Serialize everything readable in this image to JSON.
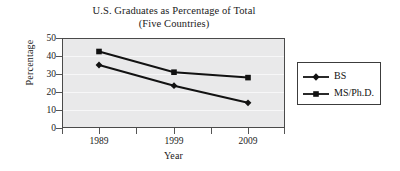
{
  "chart_data": {
    "type": "line",
    "title": "U.S. Graduates as Percentage of Total",
    "subtitle": "(Five Countries)",
    "xlabel": "Year",
    "ylabel": "Percentage",
    "categories": [
      "1989",
      "1999",
      "2009"
    ],
    "x": [
      1989,
      1999,
      2009
    ],
    "series": [
      {
        "name": "BS",
        "marker": "diamond",
        "values": [
          35,
          23.5,
          14
        ]
      },
      {
        "name": "MS/Ph.D.",
        "marker": "square",
        "values": [
          42.5,
          31,
          28
        ]
      }
    ],
    "ylim": [
      0,
      50
    ],
    "yticks": [
      0,
      10,
      20,
      30,
      40,
      50
    ],
    "ytick_labels": [
      "0",
      "10",
      "20",
      "30",
      "40",
      "50"
    ],
    "xtick_labels": [
      "1989",
      "1999",
      "2009"
    ],
    "grid": true,
    "legend_position": "right",
    "plot_background": "#e9e9ea",
    "line_color": "#121212",
    "gridline_color": "#f7f7f8",
    "frame_color": "#4a4a4a"
  },
  "legend": {
    "entries": [
      {
        "label": "BS",
        "marker": "diamond-marker-icon"
      },
      {
        "label": "MS/Ph.D.",
        "marker": "square-marker-icon"
      }
    ]
  }
}
